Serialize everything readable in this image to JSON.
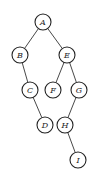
{
  "diagram": {
    "type": "binary-tree",
    "nodes": [
      {
        "id": "A",
        "label": "A",
        "x": 43,
        "y": 22
      },
      {
        "id": "B",
        "label": "B",
        "x": 20,
        "y": 55
      },
      {
        "id": "E",
        "label": "E",
        "x": 67,
        "y": 55
      },
      {
        "id": "C",
        "label": "C",
        "x": 30,
        "y": 90
      },
      {
        "id": "F",
        "label": "F",
        "x": 53,
        "y": 90
      },
      {
        "id": "G",
        "label": "G",
        "x": 79,
        "y": 90
      },
      {
        "id": "D",
        "label": "D",
        "x": 45,
        "y": 125
      },
      {
        "id": "H",
        "label": "H",
        "x": 65,
        "y": 125
      },
      {
        "id": "I",
        "label": "I",
        "x": 78,
        "y": 160
      }
    ],
    "edges": [
      {
        "from": "A",
        "to": "B"
      },
      {
        "from": "A",
        "to": "E"
      },
      {
        "from": "B",
        "to": "C"
      },
      {
        "from": "C",
        "to": "D"
      },
      {
        "from": "E",
        "to": "F"
      },
      {
        "from": "E",
        "to": "G"
      },
      {
        "from": "G",
        "to": "H"
      },
      {
        "from": "H",
        "to": "I"
      }
    ],
    "node_radius": 8
  }
}
